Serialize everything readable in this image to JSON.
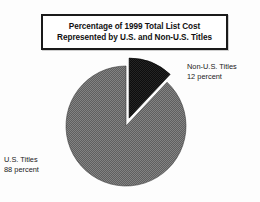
{
  "title": {
    "line1": "Percentage of 1999 Total List Cost",
    "line2": "Represented by U.S. and Non-U.S. Titles"
  },
  "labels": {
    "non_us": {
      "name": "Non-U.S. Titles",
      "value": "12 percent"
    },
    "us": {
      "name": "U.S. Titles",
      "value": "88 percent"
    }
  },
  "colors": {
    "us_slice": "#6e6e6e",
    "non_us_slice": "#141414",
    "outline": "#1a1a1a",
    "background": "#fdfdfd"
  },
  "chart_data": {
    "type": "pie",
    "title": "Percentage of 1999 Total List Cost Represented by U.S. and Non-U.S. Titles",
    "xlabel": "",
    "ylabel": "",
    "unit": "percent",
    "total": 100,
    "start_angle_deg": 0,
    "direction": "clockwise",
    "exploded_slice": "Non-U.S. Titles",
    "legend_position": "callout-labels",
    "grid": false,
    "categories": [
      "Non-U.S. Titles",
      "U.S. Titles"
    ],
    "values": [
      12,
      88
    ],
    "slices": [
      {
        "label": "Non-U.S. Titles",
        "value": 12,
        "value_text": "12 percent",
        "color": "#141414",
        "exploded": true,
        "start_angle_deg": 0,
        "end_angle_deg": 43.2
      },
      {
        "label": "U.S. Titles",
        "value": 88,
        "value_text": "88 percent",
        "color": "#6e6e6e",
        "exploded": false,
        "start_angle_deg": 43.2,
        "end_angle_deg": 360
      }
    ]
  }
}
